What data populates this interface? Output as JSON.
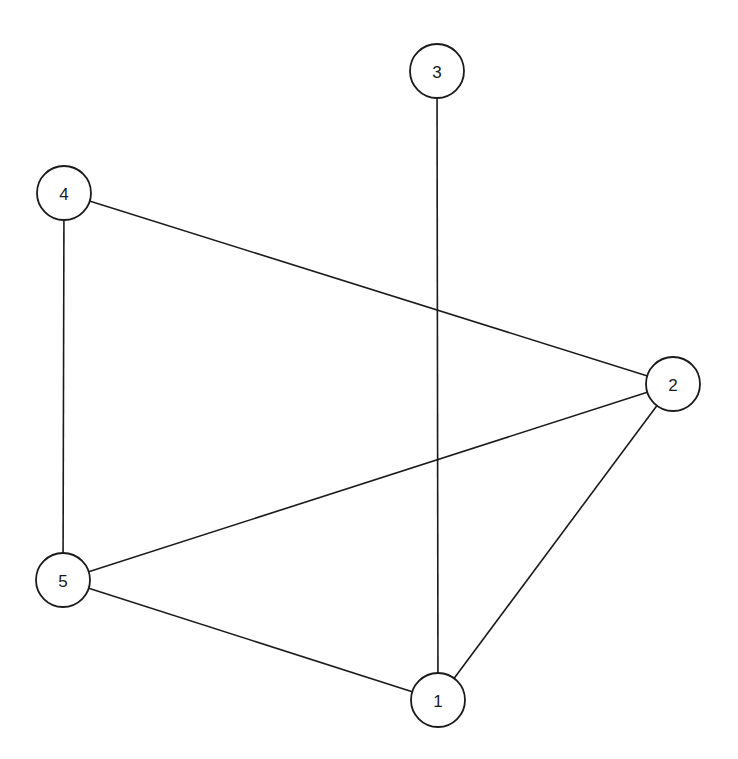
{
  "diagram": {
    "type": "undirected-graph",
    "node_radius": 27,
    "nodes": [
      {
        "id": "1",
        "label": "1",
        "x": 438,
        "y": 700
      },
      {
        "id": "2",
        "label": "2",
        "x": 673,
        "y": 384
      },
      {
        "id": "3",
        "label": "3",
        "x": 437,
        "y": 71
      },
      {
        "id": "4",
        "label": "4",
        "x": 64,
        "y": 193
      },
      {
        "id": "5",
        "label": "5",
        "x": 63,
        "y": 580
      }
    ],
    "edges": [
      {
        "from": "3",
        "to": "1"
      },
      {
        "from": "4",
        "to": "2"
      },
      {
        "from": "4",
        "to": "5"
      },
      {
        "from": "5",
        "to": "2"
      },
      {
        "from": "5",
        "to": "1"
      },
      {
        "from": "2",
        "to": "1"
      }
    ]
  }
}
